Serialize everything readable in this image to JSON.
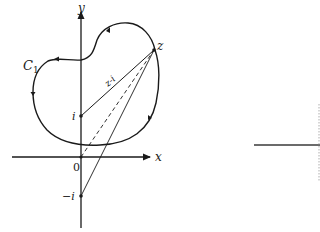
{
  "diagram": {
    "axes": {
      "x_label": "x",
      "y_label": "y",
      "origin_label": "0"
    },
    "curve": {
      "label": "C",
      "label_subscript": "1",
      "orientation": "counterclockwise"
    },
    "points": {
      "i_label": "i",
      "minus_i_label": "−i",
      "z_label": "z"
    },
    "segments": {
      "z_minus_i_label": "z-i",
      "solid_from_i": "i to z",
      "dashed_from_origin": "0 to z",
      "solid_from_minus_i": "−i to z"
    },
    "colors": {
      "ink": "#1a1a1a",
      "background": "#ffffff",
      "faint": "#9a9a9a"
    }
  }
}
